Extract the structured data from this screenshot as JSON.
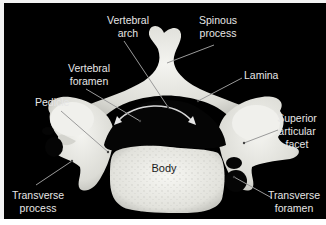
{
  "figure": {
    "background_color": "#000000",
    "bone_color": "#e8e8e4",
    "label_color": "#e6e6e6",
    "leader_color": "#9a9a9a"
  },
  "labels": {
    "vertebral_arch": {
      "line1": "Vertebral",
      "line2": "arch"
    },
    "spinous_process": {
      "line1": "Spinous",
      "line2": "process"
    },
    "vertebral_foramen": {
      "line1": "Vertebral",
      "line2": "foramen"
    },
    "lamina": {
      "line1": "Lamina"
    },
    "pedicle": {
      "line1": "Pedicle"
    },
    "superior_articular_facet": {
      "line1": "Superior",
      "line2": "articular",
      "line3": "facet"
    },
    "body": {
      "line1": "Body"
    },
    "transverse_process": {
      "line1": "Transverse",
      "line2": "process"
    },
    "transverse_foramen": {
      "line1": "Transverse",
      "line2": "foramen"
    }
  }
}
